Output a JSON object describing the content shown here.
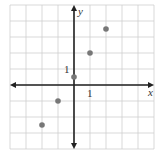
{
  "chart_data": {
    "type": "scatter",
    "title": "",
    "xlabel": "x",
    "ylabel": "y",
    "xlim": [
      -4,
      5
    ],
    "ylim": [
      -4,
      5
    ],
    "grid": true,
    "tick_labels": {
      "x": "1",
      "y": "1"
    },
    "points": [
      {
        "x": -2,
        "y": -2.5
      },
      {
        "x": -1,
        "y": -1
      },
      {
        "x": 0,
        "y": 0.5
      },
      {
        "x": 1,
        "y": 2
      },
      {
        "x": 2,
        "y": 3.5
      }
    ]
  },
  "colors": {
    "grid": "#cfcfcf",
    "axis": "#222222",
    "point": "#777777"
  },
  "labels": {
    "x_axis": "x",
    "y_axis": "y",
    "x_tick": "1",
    "y_tick": "1"
  }
}
